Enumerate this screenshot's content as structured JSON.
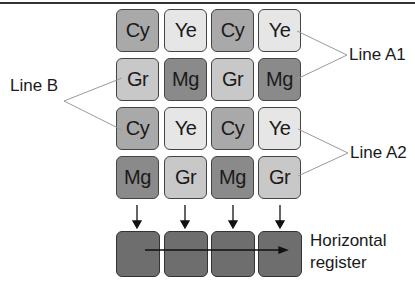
{
  "colors": {
    "Cy": "#a9a9a9",
    "Ye": "#e6e6e6",
    "Gr": "#c8c8c8",
    "Mg": "#8a8a8a",
    "register": "#6e6e6e"
  },
  "grid": [
    [
      "Cy",
      "Ye",
      "Cy",
      "Ye"
    ],
    [
      "Gr",
      "Mg",
      "Gr",
      "Mg"
    ],
    [
      "Cy",
      "Ye",
      "Cy",
      "Ye"
    ],
    [
      "Mg",
      "Gr",
      "Mg",
      "Gr"
    ]
  ],
  "labels": {
    "line_b": "Line B",
    "line_a1": "Line A1",
    "line_a2": "Line A2",
    "register_line1": "Horizontal",
    "register_line2": "register"
  }
}
